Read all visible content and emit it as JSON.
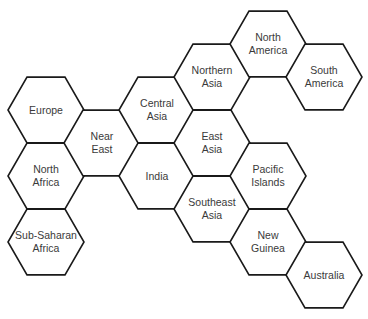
{
  "diagram": {
    "type": "hexagon-adjacency-map",
    "hex_side": 38,
    "colors": {
      "stroke": "#1a1a1a",
      "fill": "#ffffff",
      "text": "#3a3a3a"
    },
    "regions": [
      {
        "id": "europe",
        "label": "Europe",
        "lines": [
          "Europe"
        ],
        "cx": 46,
        "cy": 110
      },
      {
        "id": "north-africa",
        "label": "North Africa",
        "lines": [
          "North",
          "Africa"
        ],
        "cx": 46,
        "cy": 176
      },
      {
        "id": "sub-saharan-africa",
        "label": "Sub-Saharan Africa",
        "lines": [
          "Sub-Saharan",
          "Africa"
        ],
        "cx": 46,
        "cy": 242
      },
      {
        "id": "near-east",
        "label": "Near East",
        "lines": [
          "Near",
          "East"
        ],
        "cx": 102,
        "cy": 143
      },
      {
        "id": "central-asia",
        "label": "Central Asia",
        "lines": [
          "Central",
          "Asia"
        ],
        "cx": 157,
        "cy": 110
      },
      {
        "id": "india",
        "label": "India",
        "lines": [
          "India"
        ],
        "cx": 157,
        "cy": 176
      },
      {
        "id": "northern-asia",
        "label": "Northern Asia",
        "lines": [
          "Northern",
          "Asia"
        ],
        "cx": 212,
        "cy": 77
      },
      {
        "id": "east-asia",
        "label": "East Asia",
        "lines": [
          "East",
          "Asia"
        ],
        "cx": 212,
        "cy": 143
      },
      {
        "id": "southeast-asia",
        "label": "Southeast Asia",
        "lines": [
          "Southeast",
          "Asia"
        ],
        "cx": 212,
        "cy": 209
      },
      {
        "id": "north-america",
        "label": "North America",
        "lines": [
          "North",
          "America"
        ],
        "cx": 268,
        "cy": 44
      },
      {
        "id": "pacific-islands",
        "label": "Pacific Islands",
        "lines": [
          "Pacific",
          "Islands"
        ],
        "cx": 268,
        "cy": 176
      },
      {
        "id": "new-guinea",
        "label": "New Guinea",
        "lines": [
          "New",
          "Guinea"
        ],
        "cx": 268,
        "cy": 242
      },
      {
        "id": "south-america",
        "label": "South America",
        "lines": [
          "South",
          "America"
        ],
        "cx": 324,
        "cy": 77
      },
      {
        "id": "australia",
        "label": "Australia",
        "lines": [
          "Australia"
        ],
        "cx": 324,
        "cy": 275
      }
    ]
  }
}
